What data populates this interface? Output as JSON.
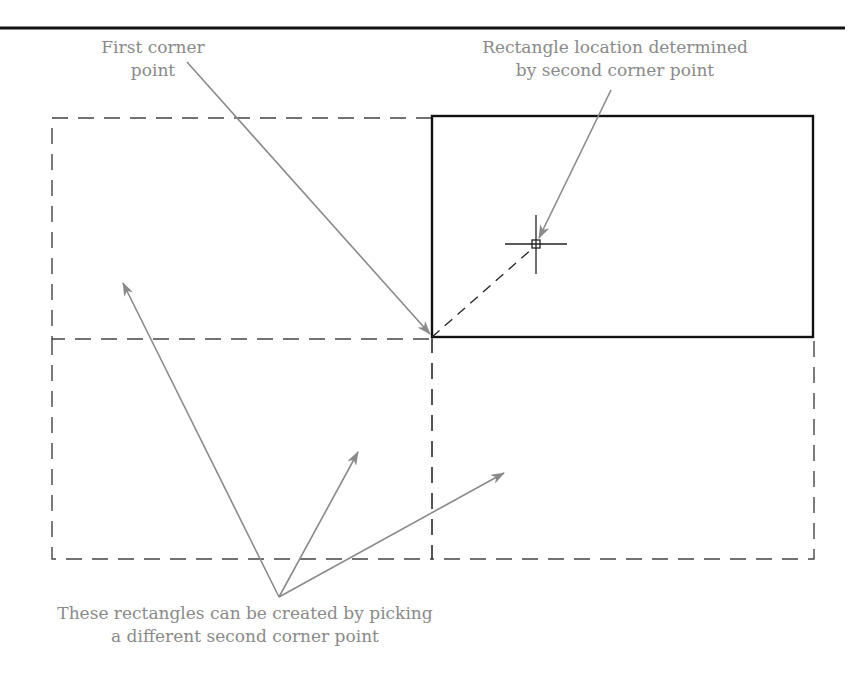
{
  "figure": {
    "top_rule": {
      "x1": 0,
      "x2": 845,
      "y": 28,
      "color": "#111111"
    },
    "colors": {
      "outline": "#111111",
      "dashed": "#444444",
      "leader": "#8a8a8a",
      "text": "#8a8a8a"
    },
    "labels": {
      "first_corner": {
        "line1": "First corner",
        "line2": "point"
      },
      "rectangle_location": {
        "line1": "Rectangle location determined",
        "line2": "by second corner point"
      },
      "alternatives": {
        "line1": "These rectangles can be created by picking",
        "line2": "a different second corner point"
      }
    },
    "first_corner_point": {
      "x": 432,
      "y": 337
    },
    "second_corner_point": {
      "x": 536,
      "y": 244
    },
    "solid_rectangle": {
      "left": 432,
      "top": 116,
      "right": 813,
      "bottom": 337
    },
    "dashed_rectangles": [
      {
        "name": "upper-left",
        "left": 52,
        "top": 118,
        "right": 432,
        "bottom": 339
      },
      {
        "name": "lower-left",
        "left": 52,
        "top": 339,
        "right": 432,
        "bottom": 559
      },
      {
        "name": "lower-right",
        "left": 432,
        "top": 337,
        "right": 814,
        "bottom": 559
      }
    ]
  }
}
